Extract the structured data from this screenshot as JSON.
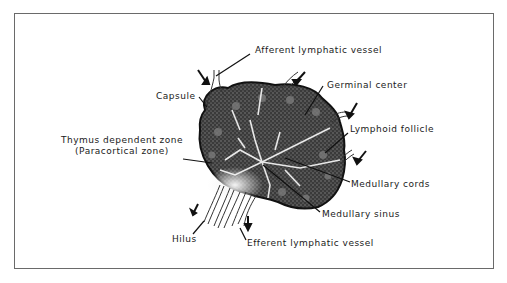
{
  "diagram": {
    "labels": {
      "afferent": "Afferent lymphatic vessel",
      "germinal": "Germinal center",
      "capsule": "Capsule",
      "follicle": "Lymphoid follicle",
      "thymus_line1": "Thymus dependent zone",
      "thymus_line2": "(Paracortical zone)",
      "cords": "Medullary cords",
      "sinus": "Medullary sinus",
      "hilus": "Hilus",
      "efferent": "Efferent lymphatic vessel"
    },
    "colors": {
      "ink": "#1a1a1a",
      "tissue_dark": "#2b2b2b",
      "tissue_mid": "#6b6b6b",
      "sinus_light": "#e8e8e8",
      "frame": "#6a6a6a"
    }
  }
}
